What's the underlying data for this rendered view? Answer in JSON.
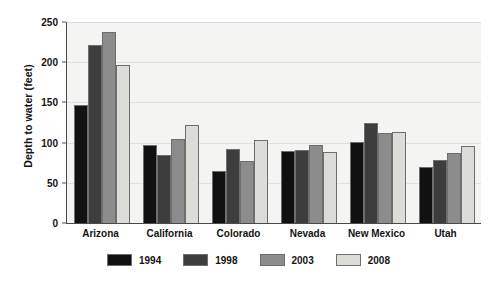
{
  "chart_data": {
    "type": "bar",
    "title": "",
    "xlabel": "",
    "ylabel": "Depth to water (feet)",
    "categories": [
      "Arizona",
      "California",
      "Colorado",
      "Nevada",
      "New Mexico",
      "Utah"
    ],
    "series": [
      {
        "name": "1994",
        "color": "#111111",
        "values": [
          147,
          97,
          65,
          90,
          101,
          70
        ]
      },
      {
        "name": "1998",
        "color": "#3d3d3d",
        "values": [
          222,
          85,
          92,
          91,
          124,
          78
        ]
      },
      {
        "name": "2003",
        "color": "#8c8c8c",
        "values": [
          237,
          105,
          77,
          97,
          112,
          87
        ]
      },
      {
        "name": "2008",
        "color": "#dcdcd8",
        "values": [
          197,
          122,
          103,
          88,
          113,
          96
        ]
      }
    ],
    "ylim": [
      0,
      250
    ],
    "yticks": [
      0,
      50,
      100,
      150,
      200,
      250
    ],
    "grid": true,
    "legend_position": "bottom",
    "plot_background": "#f4f4f2"
  }
}
